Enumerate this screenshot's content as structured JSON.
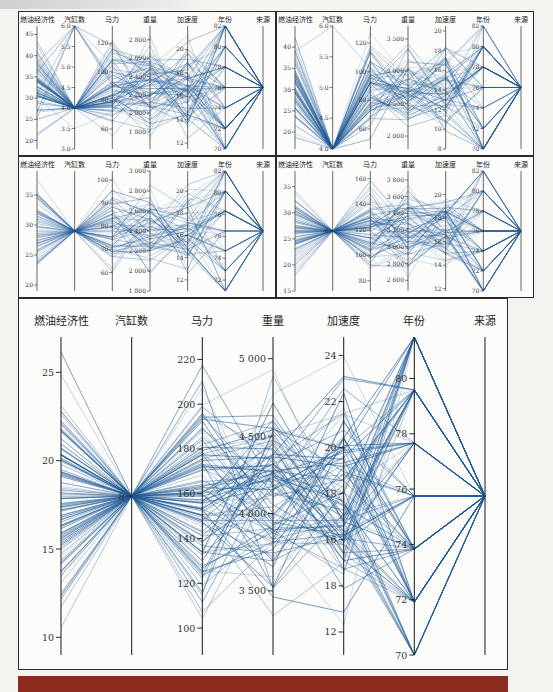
{
  "page": {
    "header_text": "",
    "bottom_bar_color": "#8c2a1f"
  },
  "panels": [
    {
      "id": "top-left",
      "x": 18,
      "y": 11,
      "w": 258,
      "h": 145
    },
    {
      "id": "top-right",
      "x": 276,
      "y": 11,
      "w": 258,
      "h": 145
    },
    {
      "id": "mid-left",
      "x": 18,
      "y": 156,
      "w": 258,
      "h": 142
    },
    {
      "id": "mid-right",
      "x": 276,
      "y": 156,
      "w": 258,
      "h": 142
    },
    {
      "id": "bottom-big",
      "x": 18,
      "y": 298,
      "w": 490,
      "h": 372
    }
  ],
  "chart_data": [
    {
      "type": "parallel_coordinates",
      "panel": "top-left",
      "line_color": "#1f5a96",
      "axes": [
        {
          "label": "燃油经济性",
          "range": [
            18,
            47
          ],
          "ticks": [
            20,
            25,
            30,
            35,
            40,
            45
          ],
          "tick_labels": [
            "20",
            "25",
            "30",
            "35",
            "40",
            "45"
          ]
        },
        {
          "label": "汽缸数",
          "range": [
            3,
            6
          ],
          "ticks": [
            3.0,
            3.5,
            4.0,
            4.5,
            5.0,
            5.5,
            6.0
          ],
          "tick_labels": [
            "3.0",
            "3.5",
            "4.0",
            "4.5",
            "5.0",
            "5.5",
            "6.0"
          ]
        },
        {
          "label": "马力",
          "range": [
            46,
            132
          ],
          "ticks": [
            60,
            80,
            100,
            120
          ],
          "tick_labels": [
            "60",
            "80",
            "100",
            "120"
          ]
        },
        {
          "label": "重量",
          "range": [
            1613,
            2950
          ],
          "ticks": [
            1800,
            2000,
            2200,
            2400,
            2600,
            2800
          ],
          "tick_labels": [
            "1 800",
            "2 000",
            "2 200",
            "2 400",
            "2 600",
            "2 800"
          ]
        },
        {
          "label": "加速度",
          "range": [
            11.5,
            22
          ],
          "ticks": [
            12,
            14,
            16,
            18,
            20
          ],
          "tick_labels": [
            "12",
            "14",
            "16",
            "18",
            "20"
          ]
        },
        {
          "label": "年份",
          "range": [
            70,
            82
          ],
          "ticks": [
            70,
            72,
            74,
            76,
            78,
            80,
            82
          ],
          "tick_labels": [
            "70",
            "72",
            "74",
            "76",
            "78",
            "80",
            "82"
          ]
        },
        {
          "label": "来源",
          "range": [
            0,
            1
          ],
          "ticks": [],
          "tick_labels": []
        }
      ],
      "n_lines": 70,
      "focus": {
        "axis": 1,
        "value": 4.0
      }
    },
    {
      "type": "parallel_coordinates",
      "panel": "top-right",
      "line_color": "#1f5a96",
      "axes": [
        {
          "label": "燃油经济性",
          "range": [
            16,
            45
          ],
          "ticks": [
            20,
            25,
            30,
            35,
            40
          ],
          "tick_labels": [
            "20",
            "25",
            "30",
            "35",
            "40"
          ]
        },
        {
          "label": "汽缸数",
          "range": [
            4,
            6
          ],
          "ticks": [
            4.0,
            4.5,
            5.0,
            5.5,
            6.0
          ],
          "tick_labels": [
            "4.0",
            "4.5",
            "5.0",
            "5.5",
            "6.0"
          ]
        },
        {
          "label": "马力",
          "range": [
            46,
            132
          ],
          "ticks": [
            60,
            80,
            100,
            120
          ],
          "tick_labels": [
            "60",
            "80",
            "100",
            "120"
          ]
        },
        {
          "label": "重量",
          "range": [
            1800,
            3700
          ],
          "ticks": [
            2000,
            2500,
            3000,
            3500
          ],
          "tick_labels": [
            "2 000",
            "2 500",
            "3 000",
            "3 500"
          ]
        },
        {
          "label": "加速度",
          "range": [
            8,
            20.5
          ],
          "ticks": [
            8,
            10,
            12,
            14,
            16,
            18,
            20
          ],
          "tick_labels": [
            "8",
            "10",
            "12",
            "14",
            "16",
            "18",
            "20"
          ]
        },
        {
          "label": "年份",
          "range": [
            70,
            82
          ],
          "ticks": [
            70,
            72,
            74,
            76,
            78,
            80,
            82
          ],
          "tick_labels": [
            "70",
            "72",
            "74",
            "76",
            "78",
            "80",
            "82"
          ]
        },
        {
          "label": "来源",
          "range": [
            0,
            1
          ],
          "ticks": [],
          "tick_labels": []
        }
      ],
      "n_lines": 60,
      "focus": {
        "axis": 1,
        "value": 4.0
      }
    },
    {
      "type": "parallel_coordinates",
      "panel": "mid-left",
      "line_color": "#1f5a96",
      "axes": [
        {
          "label": "燃油经济性",
          "range": [
            19,
            39
          ],
          "ticks": [
            20,
            25,
            30,
            35
          ],
          "tick_labels": [
            "20",
            "25",
            "30",
            "35"
          ]
        },
        {
          "label": "汽缸数",
          "range": [
            0,
            1
          ],
          "ticks": [],
          "tick_labels": []
        },
        {
          "label": "马力",
          "range": [
            52,
            104
          ],
          "ticks": [
            60,
            70,
            80,
            90,
            100
          ],
          "tick_labels": [
            "60",
            "70",
            "80",
            "90",
            "100"
          ]
        },
        {
          "label": "重量",
          "range": [
            1800,
            3000
          ],
          "ticks": [
            1800,
            2000,
            2200,
            2400,
            2600,
            2800,
            3000
          ],
          "tick_labels": [
            "1 800",
            "2 000",
            "2 200",
            "2 400",
            "2 600",
            "2 800",
            "3 000"
          ]
        },
        {
          "label": "加速度",
          "range": [
            11,
            21.8
          ],
          "ticks": [
            12,
            14,
            16,
            18,
            20
          ],
          "tick_labels": [
            "12",
            "14",
            "16",
            "18",
            "20"
          ]
        },
        {
          "label": "年份",
          "range": [
            71,
            82
          ],
          "ticks": [
            72,
            74,
            76,
            78,
            80,
            82
          ],
          "tick_labels": [
            "72",
            "74",
            "76",
            "78",
            "80",
            "82"
          ]
        },
        {
          "label": "来源",
          "range": [
            0,
            1
          ],
          "ticks": [],
          "tick_labels": []
        }
      ],
      "n_lines": 60,
      "focus": {
        "axis": 1,
        "value": 0.5
      }
    },
    {
      "type": "parallel_coordinates",
      "panel": "mid-right",
      "line_color": "#1f5a96",
      "axes": [
        {
          "label": "燃油经济性",
          "range": [
            15,
            38
          ],
          "ticks": [
            15,
            20,
            25,
            30,
            35
          ],
          "tick_labels": [
            "15",
            "20",
            "25",
            "30",
            "35"
          ]
        },
        {
          "label": "汽缸数",
          "range": [
            0,
            1
          ],
          "ticks": [
            0.5
          ],
          "tick_labels": [
            "6"
          ]
        },
        {
          "label": "马力",
          "range": [
            72,
            166
          ],
          "ticks": [
            80,
            100,
            120,
            140,
            160
          ],
          "tick_labels": [
            "80",
            "100",
            "120",
            "140",
            "160"
          ]
        },
        {
          "label": "重量",
          "range": [
            2472,
            3907
          ],
          "ticks": [
            2600,
            2800,
            3000,
            3200,
            3400,
            3600,
            3800
          ],
          "tick_labels": [
            "2 600",
            "2 800",
            "3 000",
            "3 200",
            "3 400",
            "3 600",
            "3 800"
          ]
        },
        {
          "label": "加速度",
          "range": [
            11.8,
            22
          ],
          "ticks": [
            12,
            14,
            16,
            18,
            20
          ],
          "tick_labels": [
            "12",
            "14",
            "16",
            "18",
            "20"
          ]
        },
        {
          "label": "年份",
          "range": [
            70,
            82
          ],
          "ticks": [
            70,
            72,
            74,
            76,
            78,
            80,
            82
          ],
          "tick_labels": [
            "70",
            "72",
            "74",
            "76",
            "78",
            "80",
            "82"
          ]
        },
        {
          "label": "来源",
          "range": [
            0,
            1
          ],
          "ticks": [],
          "tick_labels": []
        }
      ],
      "n_lines": 70,
      "focus": {
        "axis": 1,
        "value": 0.5
      }
    },
    {
      "type": "parallel_coordinates",
      "panel": "bottom-big",
      "line_color": "#1f5a96",
      "axes": [
        {
          "label": "燃油经济性",
          "range": [
            9,
            27
          ],
          "ticks": [
            10,
            15,
            20,
            25
          ],
          "tick_labels": [
            "10",
            "15",
            "20",
            "25"
          ]
        },
        {
          "label": "汽缸数",
          "range": [
            0,
            1
          ],
          "ticks": [
            0.5
          ],
          "tick_labels": [
            "8"
          ]
        },
        {
          "label": "马力",
          "range": [
            88,
            230
          ],
          "ticks": [
            100,
            120,
            140,
            160,
            180,
            200,
            220
          ],
          "tick_labels": [
            "100",
            "120",
            "140",
            "160",
            "180",
            "200",
            "220"
          ]
        },
        {
          "label": "重量",
          "range": [
            3086,
            5140
          ],
          "ticks": [
            3500,
            4000,
            4500,
            5000
          ],
          "tick_labels": [
            "3 500",
            "4 000",
            "4 500",
            "5 000"
          ]
        },
        {
          "label": "加速度",
          "range": [
            11,
            24.8
          ],
          "ticks": [
            12,
            14,
            16,
            18,
            20,
            22,
            24
          ],
          "tick_labels": [
            "12",
            "18",
            "16",
            "18",
            "20",
            "22",
            "24"
          ]
        },
        {
          "label": "年份",
          "range": [
            70,
            81.5
          ],
          "ticks": [
            70,
            72,
            74,
            76,
            78,
            80
          ],
          "tick_labels": [
            "70",
            "72",
            "74",
            "76",
            "78",
            "80"
          ]
        },
        {
          "label": "来源",
          "range": [
            0,
            1
          ],
          "ticks": [],
          "tick_labels": []
        }
      ],
      "n_lines": 100,
      "focus": {
        "axis": 1,
        "value": 0.5
      }
    }
  ]
}
